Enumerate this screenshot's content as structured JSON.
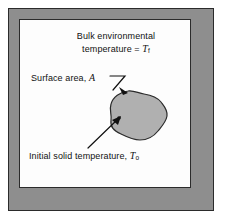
{
  "figure": {
    "title_region": "heat-transfer-lumped-capacitance-schematic",
    "bulk_line1": "Bulk environmental",
    "bulk_line2_prefix": "temperature = ",
    "bulk_symbol": "T",
    "bulk_subscript": "f",
    "surface_text": "Surface area, ",
    "surface_symbol": "A",
    "solid_word": "Solid",
    "solid_symbol": "T",
    "solid_arg": "(t)",
    "initial_text": "Initial solid temperature, ",
    "initial_symbol": "T",
    "initial_subscript": "o"
  },
  "colors": {
    "environment_band": "#8e8e8e",
    "inner_panel": "#fdfdfd",
    "solid_fill": "#b0b0b0",
    "outline": "#2b2b2b",
    "text": "#111111",
    "page_background": "#ffffff"
  }
}
